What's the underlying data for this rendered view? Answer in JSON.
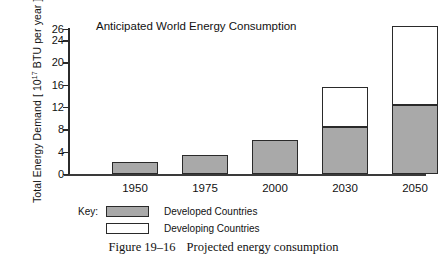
{
  "chart_data": {
    "type": "bar",
    "title": "Anticipated World Energy Consumption",
    "xlabel": "",
    "ylabel": "Total Energy Demand [ 10^17 BTU per year ]",
    "ylabel_prefix": "Total Energy Demand [ 10",
    "ylabel_exponent": "17",
    "ylabel_suffix": " BTU per year ]",
    "categories": [
      "1950",
      "1975",
      "2000",
      "2030",
      "2050"
    ],
    "series": [
      {
        "name": "Developed Countries",
        "values": [
          2.1,
          3.4,
          6.1,
          8.4,
          12.4
        ]
      },
      {
        "name": "Developing Countries",
        "values": [
          0,
          0,
          0,
          7.2,
          14.1
        ]
      }
    ],
    "totals": [
      2.1,
      3.4,
      6.1,
      15.6,
      26.5
    ],
    "stacked": true,
    "ylim": [
      0,
      26
    ],
    "yticks": [
      0,
      4,
      8,
      12,
      16,
      20,
      24,
      26
    ],
    "ytick_labels": [
      "0",
      "4",
      "8",
      "12",
      "16",
      "20",
      "24",
      "26"
    ],
    "grid": false,
    "legend_position": "below-axes",
    "colors": {
      "developed": "#a9a9a9",
      "developing": "#ffffff",
      "outline": "#2a2a2a",
      "axis": "#2b2b2b"
    }
  },
  "legend": {
    "key_label": "Key:",
    "entries": [
      {
        "label": "Developed Countries",
        "swatch": "gray"
      },
      {
        "label": "Developing Countries",
        "swatch": "white"
      }
    ]
  },
  "caption": {
    "figure_number": "Figure 19–16",
    "text": "Projected energy consumption"
  }
}
